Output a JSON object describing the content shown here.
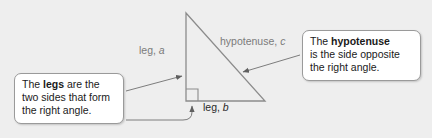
{
  "figure": {
    "background_color": "#eeeeee",
    "triangle": {
      "stroke_color": "#8c8c8c",
      "apex": [
        186,
        13
      ],
      "right_angle_vertex": [
        186,
        101
      ],
      "bottom_right_vertex": [
        265,
        101
      ],
      "right_angle_marker": true
    },
    "labels": {
      "leg_a": "leg, a",
      "leg_a_plain": "leg, ",
      "leg_a_var": "a",
      "hypotenuse_c_plain": "hypotenuse, ",
      "hypotenuse_c_var": "c",
      "leg_b_plain": "leg, ",
      "leg_b_var": "b"
    }
  },
  "callouts": {
    "legs": {
      "line1_pre": "The ",
      "line1_bold": "legs",
      "line1_post": " are the",
      "line2": "two sides that form",
      "line3": "the right angle."
    },
    "hypotenuse": {
      "line1_pre": "The ",
      "line1_bold": "hypotenuse",
      "line2": "is the side opposite",
      "line3": "the right angle."
    }
  },
  "colors": {
    "background": "#eeeeee",
    "callout_fill": "#ffffff",
    "callout_border": "#9a9a9a",
    "triangle_stroke": "#8c8c8c",
    "connector_stroke": "#6f6f6f",
    "label_gray": "#7b7b7b",
    "label_dark": "#2a2a2a"
  }
}
